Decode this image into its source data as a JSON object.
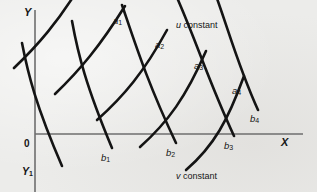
{
  "figure": {
    "background_color": "#ececea",
    "ink_color": "#141414",
    "axis_color": "#6e6e6e",
    "width": 317,
    "height": 192
  },
  "axes": {
    "x_label": "X",
    "y_label": "Y",
    "y_secondary_label": "Y",
    "y_secondary_sub": "1",
    "origin_label": "0",
    "x_axis": {
      "x1": 35,
      "y1": 134,
      "x2": 303,
      "y2": 134
    },
    "y_axis": {
      "x1": 35,
      "y1": 10,
      "x2": 35,
      "y2": 192
    }
  },
  "captions": {
    "u_family": {
      "symbol": "u",
      "text": " constant"
    },
    "v_family": {
      "symbol": "v",
      "text": " constant"
    }
  },
  "curve_labels": {
    "u_constant": [
      {
        "name": "a",
        "sub": "1",
        "x": 113,
        "y": 16
      },
      {
        "name": "a",
        "sub": "2",
        "x": 155,
        "y": 40
      },
      {
        "name": "a",
        "sub": "3",
        "x": 194,
        "y": 61
      },
      {
        "name": "a",
        "sub": "4",
        "x": 232,
        "y": 86
      }
    ],
    "v_constant": [
      {
        "name": "b",
        "sub": "1",
        "x": 101,
        "y": 153
      },
      {
        "name": "b",
        "sub": "2",
        "x": 166,
        "y": 148
      },
      {
        "name": "b",
        "sub": "3",
        "x": 224,
        "y": 141
      },
      {
        "name": "b",
        "sub": "4",
        "x": 250,
        "y": 114
      }
    ]
  },
  "chart_data": {
    "type": "line",
    "title": "",
    "xlabel": "X",
    "ylabel": "Y",
    "grid": false,
    "legend": [
      "u constant",
      "v constant"
    ],
    "series": [
      {
        "name": "u constant",
        "label": "a1",
        "path": "M 55,94 C 80,70 100,46 125,6"
      },
      {
        "name": "u constant",
        "label": "a2",
        "path": "M 97,120 C 124,96 144,72 167,30"
      },
      {
        "name": "u constant",
        "label": "a3",
        "path": "M 140,147 C 168,122 186,97 206,51"
      },
      {
        "name": "u constant",
        "label": "a4",
        "path": "M 186,170 C 214,146 228,120 244,76"
      },
      {
        "name": "u constant",
        "label": "a0",
        "path": "M 14,68 C 38,45 58,22 80,-14"
      },
      {
        "name": "v constant",
        "label": "b1",
        "path": "M 72,21 C 78,54 86,86 112,148"
      },
      {
        "name": "v constant",
        "label": "b2",
        "path": "M 122,5 C 136,46 148,84 176,143"
      },
      {
        "name": "v constant",
        "label": "b3",
        "path": "M 175,-7 C 196,40 208,80 234,136"
      },
      {
        "name": "v constant",
        "label": "b4",
        "path": "M 208,-26 C 226,20 236,62 258,110"
      },
      {
        "name": "v constant",
        "label": "b0",
        "path": "M 22,43 C 28,74 36,106 62,166"
      }
    ],
    "cross_hatch": [
      {
        "name": "u constant",
        "path": "M 14,68 C 38,45 58,22 80,-14"
      },
      {
        "name": "u constant",
        "path": "M 55,94 C 80,70 100,46 125,6"
      },
      {
        "name": "u constant",
        "path": "M 97,120 C 124,96 144,72 167,30"
      },
      {
        "name": "u constant",
        "path": "M 140,147 C 168,122 186,97 206,51"
      },
      {
        "name": "u constant",
        "path": "M 186,170 C 214,146 228,120 244,76"
      },
      {
        "name": "v constant",
        "path": "M 22,43 C 28,74 36,106 62,166"
      },
      {
        "name": "v constant",
        "path": "M 72,21 C 78,54 86,86 112,148"
      },
      {
        "name": "v constant",
        "path": "M 122,5 C 136,46 148,84 176,143"
      },
      {
        "name": "v constant",
        "path": "M 175,-7 C 196,40 208,80 234,136"
      },
      {
        "name": "v constant",
        "path": "M 208,-26 C 226,20 236,62 258,110"
      }
    ]
  }
}
